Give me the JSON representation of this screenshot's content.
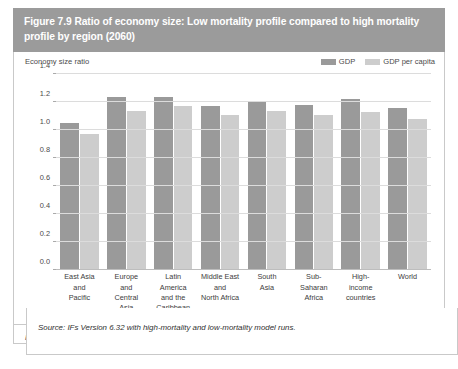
{
  "figure": {
    "title": "Figure 7.9 Ratio of economy size: Low mortality profile compared to high mortality profile by region (2060)",
    "header_color": "#9b9b9b",
    "note": "Note: Using purchasing power parity.",
    "source": "Source: IFs Version 6.32 with high-mortality and low-mortality model runs."
  },
  "chart_data": {
    "type": "bar",
    "title": "Figure 7.9 Ratio of economy size: Low mortality profile compared to high mortality profile by region (2060)",
    "xlabel": "",
    "ylabel": "Economy size ratio",
    "ylim": [
      0.0,
      1.4
    ],
    "yticks": [
      "0.0",
      "0.2",
      "0.4",
      "0.6",
      "0.8",
      "1.0",
      "1.2",
      "1.4"
    ],
    "ytick_values": [
      0.0,
      0.2,
      0.4,
      0.6,
      0.8,
      1.0,
      1.2,
      1.4
    ],
    "grid": true,
    "legend_position": "top-right",
    "categories": [
      "East Asia and Pacific",
      "Europe and Central Asia",
      "Latin America and the Caribbean",
      "Middle East and North Africa",
      "South Asia",
      "Sub-Saharan Africa",
      "High-income countries",
      "World"
    ],
    "category_lines": [
      [
        "East Asia",
        "and",
        "Pacific"
      ],
      [
        "Europe",
        "and",
        "Central",
        "Asia"
      ],
      [
        "Latin",
        "America",
        "and the",
        "Caribbean"
      ],
      [
        "Middle East",
        "and",
        "North Africa"
      ],
      [
        "South",
        "Asia"
      ],
      [
        "Sub-",
        "Saharan",
        "Africa"
      ],
      [
        "High-",
        "income",
        "countries"
      ],
      [
        "World"
      ]
    ],
    "series": [
      {
        "name": "GDP",
        "color": "#9a9a9a",
        "values": [
          1.05,
          1.24,
          1.24,
          1.17,
          1.21,
          1.18,
          1.22,
          1.16
        ]
      },
      {
        "name": "GDP per capita",
        "color": "#cdcdcd",
        "values": [
          0.97,
          1.14,
          1.17,
          1.11,
          1.14,
          1.11,
          1.13,
          1.08
        ]
      }
    ]
  }
}
